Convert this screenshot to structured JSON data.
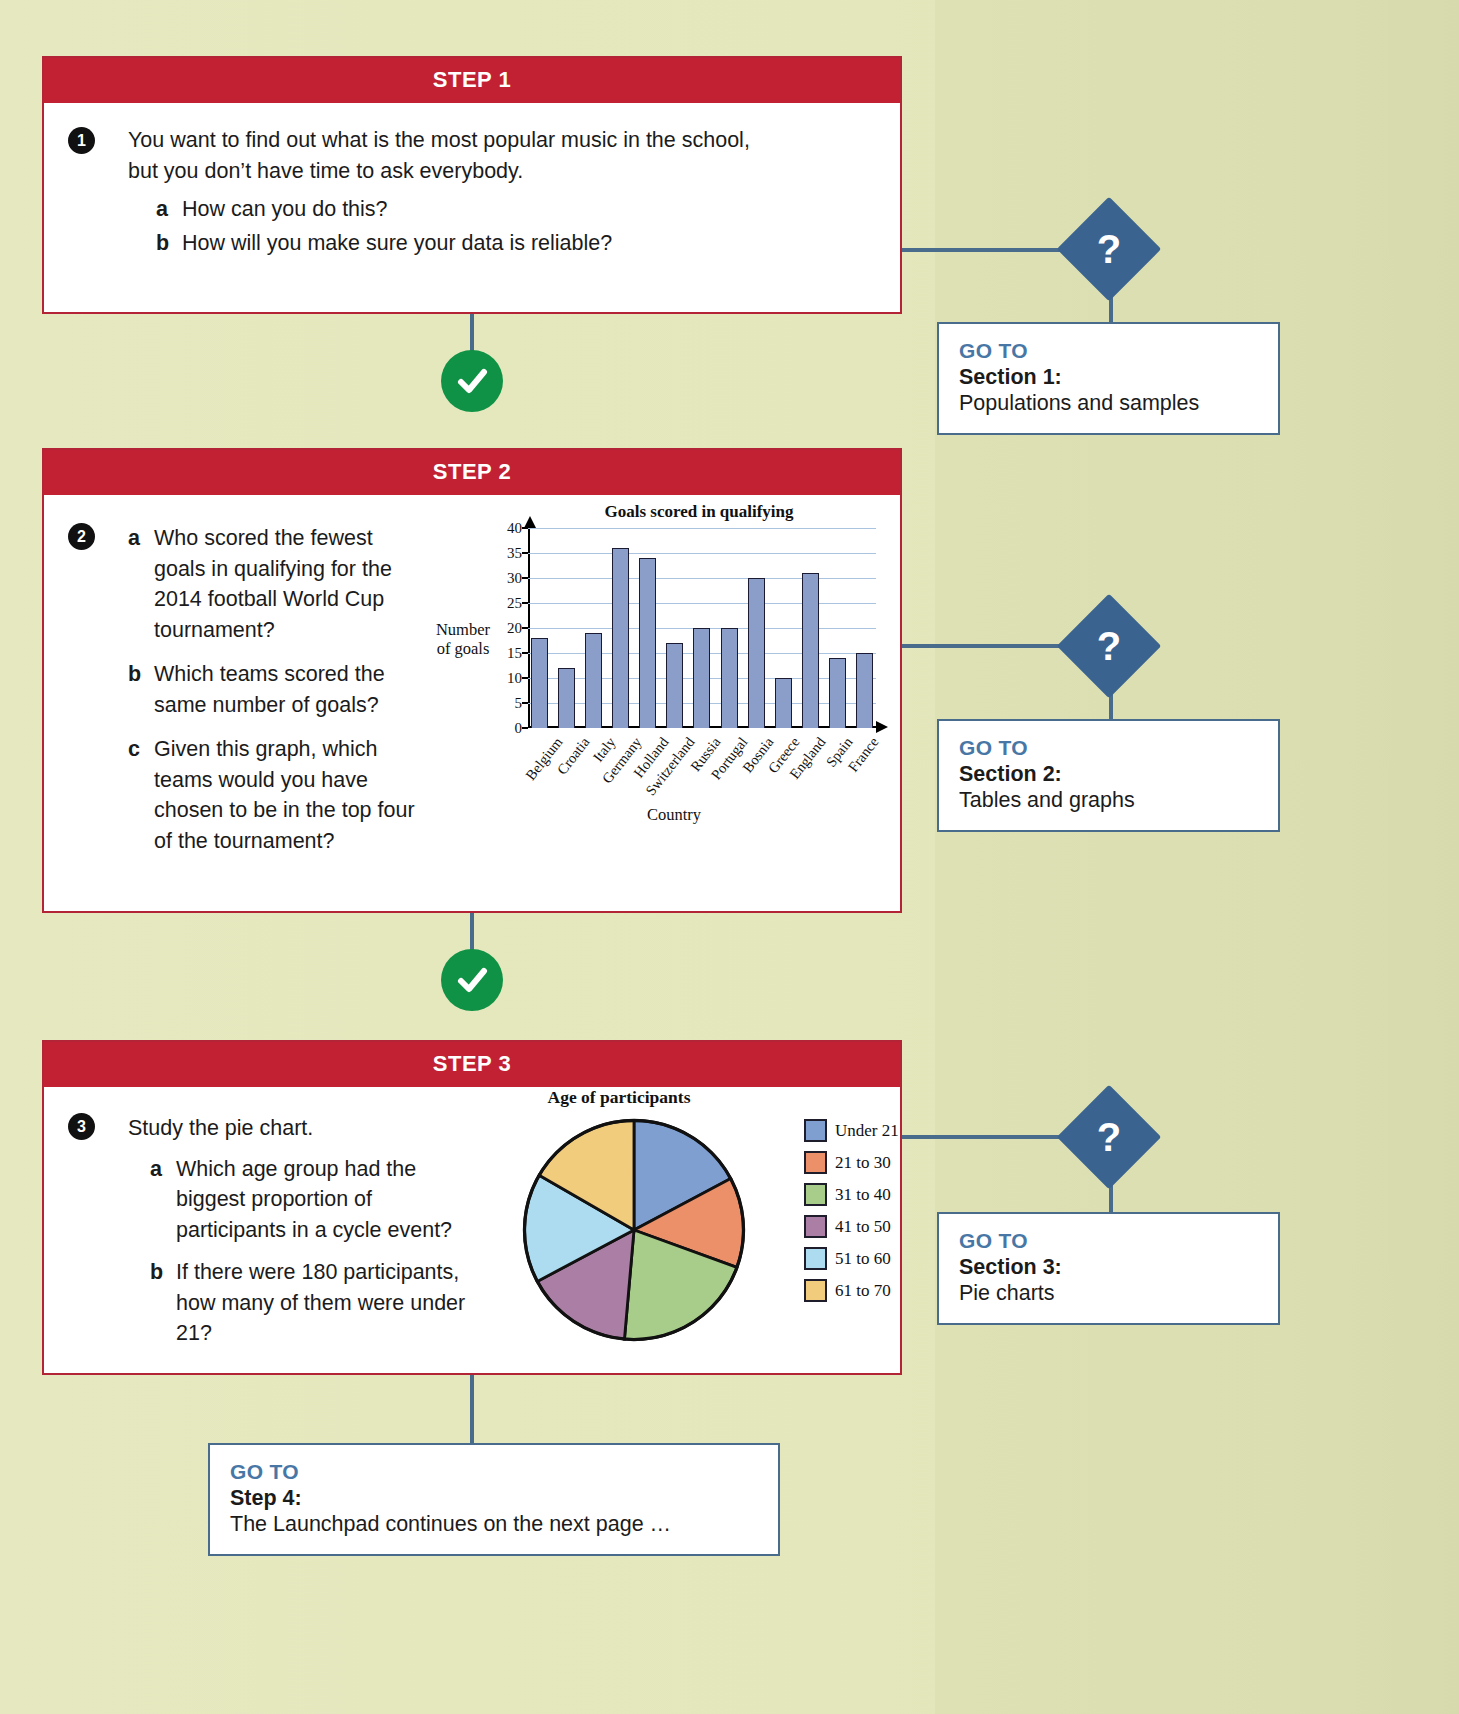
{
  "theme": {
    "page_bg": "#e5e8bd",
    "step_header_red": "#c22033",
    "card_border_red": "#b32437",
    "connector_blue": "#4a6c8c",
    "goto_label_blue": "#4877a6",
    "diamond_blue": "#3b6390",
    "check_green": "#0f9245"
  },
  "steps": [
    {
      "header": "STEP 1",
      "number": "1",
      "intro_line1": "You want to find out what is the most popular music in the school,",
      "intro_line2": "but you don’t have time to ask everybody.",
      "items": [
        {
          "letter": "a",
          "text": "How can you do this?"
        },
        {
          "letter": "b",
          "text": "How will you make sure your data is reliable?"
        }
      ]
    },
    {
      "header": "STEP 2",
      "number": "2",
      "items": [
        {
          "letter": "a",
          "text": "Who scored the fewest goals in qualifying for the 2014 football World Cup tournament?"
        },
        {
          "letter": "b",
          "text": "Which teams scored the same number of goals?"
        },
        {
          "letter": "c",
          "text": "Given this graph, which teams would you have chosen to be in the top four of the tournament?"
        }
      ]
    },
    {
      "header": "STEP 3",
      "number": "3",
      "intro_line1": "Study the pie chart.",
      "items": [
        {
          "letter": "a",
          "text": "Which age group had the biggest proportion of participants in a cycle event?"
        },
        {
          "letter": "b",
          "text": "If there were 180 participants, how many of them were under 21?"
        }
      ]
    }
  ],
  "goto_boxes": [
    {
      "label": "GO TO",
      "target": "Section 1:",
      "desc": "Populations and samples"
    },
    {
      "label": "GO TO",
      "target": "Section 2:",
      "desc": "Tables and graphs"
    },
    {
      "label": "GO TO",
      "target": "Section 3:",
      "desc": "Pie charts"
    },
    {
      "label": "GO TO",
      "target": "Step 4:",
      "desc": "The Launchpad continues on the next page …"
    }
  ],
  "diamond_glyph": "?",
  "check_glyph": "✓",
  "chart_data": [
    {
      "type": "bar",
      "title": "Goals scored in qualifying",
      "xlabel": "Country",
      "ylabel": "Number of goals",
      "categories": [
        "Belgium",
        "Croatia",
        "Italy",
        "Germany",
        "Holland",
        "Switzerland",
        "Russia",
        "Portugal",
        "Bosnia",
        "Greece",
        "England",
        "Spain",
        "France"
      ],
      "values": [
        18,
        12,
        19,
        36,
        34,
        17,
        20,
        20,
        30,
        10,
        31,
        14,
        15
      ],
      "ylim": [
        0,
        40
      ],
      "yticks": [
        0,
        5,
        10,
        15,
        20,
        25,
        30,
        35,
        40
      ],
      "grid": true,
      "bar_color": "#8b9dc9",
      "bar_edge": "#1a1a33",
      "legend": "none"
    },
    {
      "type": "pie",
      "title": "Age of participants",
      "labels": [
        "Under 21",
        "21 to 30",
        "31 to 40",
        "41 to 50",
        "51 to 60",
        "61 to 70"
      ],
      "values": [
        62,
        48,
        75,
        57,
        58,
        60
      ],
      "unit": "degrees",
      "colors": [
        "#7e9fd0",
        "#ec9069",
        "#a8cd8b",
        "#ab7fa5",
        "#addcf0",
        "#f2cc7d"
      ],
      "edge_color": "#111111",
      "legend_position": "right",
      "start_angle_deg": 0,
      "direction": "clockwise"
    }
  ]
}
